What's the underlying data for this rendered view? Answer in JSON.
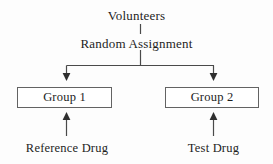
{
  "diagram": {
    "title_text": "Volunteers",
    "assignment_text": "Random Assignment",
    "groups": [
      {
        "label": "Group 1",
        "treatment": "Reference Drug"
      },
      {
        "label": "Group 2",
        "treatment": "Test Drug"
      }
    ],
    "colors": {
      "background": "#fdfdfd",
      "text": "#1d1d1d",
      "box_border": "#636363",
      "connector": "#4a4a4a"
    },
    "connectors": {
      "volunteers_to_assignment": "vertical-line",
      "assignment_stem": "vertical-line",
      "split_bar": "horizontal-line",
      "left_branch_arrow": "arrow-down",
      "right_branch_arrow": "arrow-down",
      "reference_drug_arrow": "arrow-up",
      "test_drug_arrow": "arrow-up"
    }
  }
}
